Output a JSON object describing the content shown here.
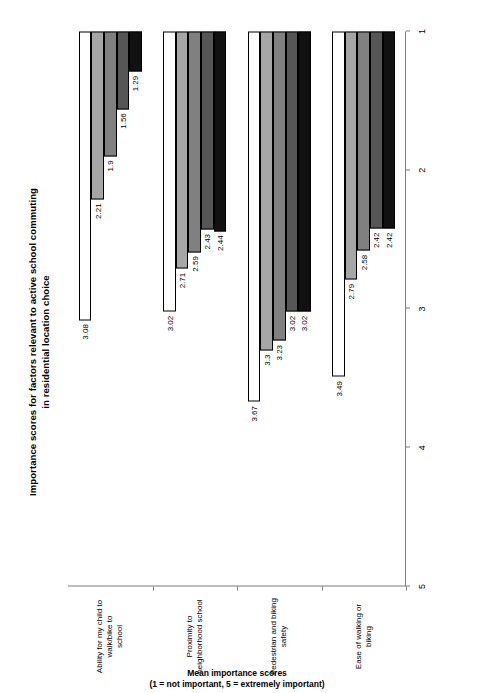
{
  "chart_data": {
    "type": "bar",
    "orientation": "horizontal",
    "title": "Importance scores for factors relevant to active school commuting in residential location choice",
    "title_lines": [
      "Importance scores for factors relevant to active school commuting",
      "in residential location choice"
    ],
    "xlabel": "",
    "ylabel": "Mean importance scores (1 = not important, 5 = extremely important)",
    "ylabel_lines": [
      "Mean importance scores",
      "(1 = not important, 5 = extremely important)"
    ],
    "ylim": [
      1,
      5
    ],
    "axis_reversed": true,
    "tick_labels": [
      "5",
      "4",
      "3",
      "2",
      "1"
    ],
    "tick_values": [
      5,
      4,
      3,
      2,
      1
    ],
    "grid": false,
    "legend": "none",
    "categories": [
      "Ability for my child to walk/bike to school",
      "Proximity to neighborhood school",
      "Pedestrian and biking safety",
      "Ease of walking or biking"
    ],
    "category_lines": [
      [
        "Ability for my child to walk/bike to",
        "school"
      ],
      [
        "Proximity to neighborhood school"
      ],
      [
        "Pedestrian and biking safety"
      ],
      [
        "Ease of walking or biking"
      ]
    ],
    "series": [
      {
        "name": "series-1",
        "color": "#ffffff",
        "values": [
          3.08,
          3.02,
          3.67,
          3.49
        ]
      },
      {
        "name": "series-2",
        "color": "#a6a6a6",
        "values": [
          2.21,
          2.71,
          3.3,
          2.79
        ]
      },
      {
        "name": "series-3",
        "color": "#808080",
        "values": [
          1.9,
          2.59,
          3.23,
          2.58
        ]
      },
      {
        "name": "series-4",
        "color": "#565656",
        "values": [
          1.56,
          2.43,
          3.02,
          2.42
        ]
      },
      {
        "name": "series-5",
        "color": "#111111",
        "values": [
          1.29,
          2.44,
          3.02,
          2.42
        ]
      }
    ],
    "data_labels": [
      [
        "3.08",
        "2.21",
        "1.9",
        "1.56",
        "1.29"
      ],
      [
        "3.02",
        "2.71",
        "2.59",
        "2.43",
        "2.44"
      ],
      [
        "3.67",
        "3.3",
        "3.23",
        "3.02",
        "3.02"
      ],
      [
        "3.49",
        "2.79",
        "2.58",
        "2.42",
        "2.42"
      ]
    ],
    "colors": {
      "axis": "#7f7f7f",
      "bar_outline": "#000000",
      "text": "#000000",
      "background": "#ffffff"
    }
  }
}
